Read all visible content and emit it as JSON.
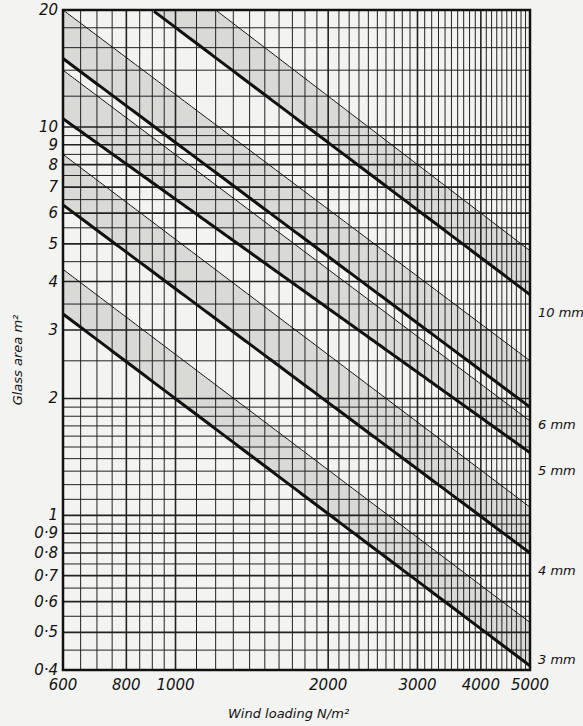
{
  "chart_data": {
    "type": "line",
    "title": "",
    "xlabel": "Wind loading   N/m²",
    "ylabel": "Glass area   m²",
    "xscale": "log",
    "yscale": "log",
    "xlim": [
      600,
      5000
    ],
    "ylim": [
      0.4,
      20
    ],
    "grid": true,
    "x_ticks": [
      600,
      800,
      1000,
      2000,
      3000,
      4000,
      5000
    ],
    "x_tick_labels": [
      "600",
      "800",
      "1000",
      "2000",
      "3000",
      "4000",
      "5000"
    ],
    "y_ticks": [
      0.4,
      0.5,
      0.6,
      0.7,
      0.8,
      0.9,
      1,
      2,
      3,
      4,
      5,
      6,
      7,
      8,
      9,
      10,
      20
    ],
    "y_tick_labels": [
      "0·4",
      "0·5",
      "0·6",
      "0·7",
      "0·8",
      "0·9",
      "1",
      "2",
      "3",
      "4",
      "5",
      "6",
      "7",
      "8",
      "9",
      "10",
      "20"
    ],
    "series": [
      {
        "name": "3mm",
        "kind": "thick",
        "points": [
          [
            600,
            3.3
          ],
          [
            5000,
            0.41
          ]
        ]
      },
      {
        "name": "3mm band upper",
        "kind": "thin",
        "points": [
          [
            600,
            4.3
          ],
          [
            5000,
            0.53
          ]
        ]
      },
      {
        "name": "4mm",
        "kind": "thick",
        "points": [
          [
            600,
            6.3
          ],
          [
            5000,
            0.8
          ]
        ]
      },
      {
        "name": "4mm band upper",
        "kind": "thin",
        "points": [
          [
            600,
            8.5
          ],
          [
            5000,
            1.05
          ]
        ]
      },
      {
        "name": "5mm",
        "kind": "thick",
        "points": [
          [
            600,
            10.5
          ],
          [
            5000,
            1.45
          ]
        ]
      },
      {
        "name": "5mm band upper",
        "kind": "thin",
        "points": [
          [
            600,
            14
          ],
          [
            5000,
            1.75
          ]
        ]
      },
      {
        "name": "6mm",
        "kind": "thick",
        "points": [
          [
            600,
            15
          ],
          [
            5000,
            1.9
          ]
        ]
      },
      {
        "name": "6mm band upper",
        "kind": "thin",
        "points": [
          [
            600,
            20
          ],
          [
            5000,
            2.5
          ]
        ]
      },
      {
        "name": "10mm",
        "kind": "thick",
        "points": [
          [
            900,
            20
          ],
          [
            5000,
            3.7
          ]
        ]
      },
      {
        "name": "10mm band upper",
        "kind": "thin",
        "points": [
          [
            1200,
            20
          ],
          [
            5000,
            4.8
          ]
        ]
      }
    ],
    "line_labels": [
      "10mm",
      "6mm",
      "5mm",
      "4mm",
      "3mm"
    ]
  }
}
